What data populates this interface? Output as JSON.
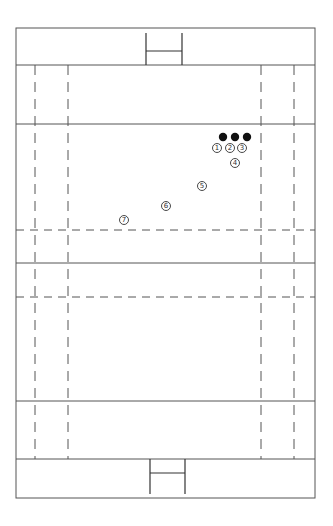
{
  "diagram": {
    "type": "rugby-pitch-play-diagram",
    "stroke_color": "#555555",
    "player_color": "#111111",
    "field": {
      "outer": {
        "x": 16,
        "y": 28,
        "w": 299,
        "h": 470
      },
      "solid_lines_y": [
        65,
        124,
        263,
        401,
        459
      ],
      "dashed_lines_y": [
        230,
        297
      ],
      "dashed_lines_x": [
        35,
        68,
        261,
        294
      ]
    },
    "posts": [
      {
        "position": "top",
        "left_x": 146,
        "right_x": 182,
        "y1": 33,
        "y2": 65,
        "crossbar_y": 51
      },
      {
        "position": "bottom",
        "left_x": 150,
        "right_x": 185,
        "y1": 459,
        "y2": 494,
        "crossbar_y": 473
      }
    ],
    "defenders": [
      {
        "id": "d1",
        "x": 223,
        "y": 137
      },
      {
        "id": "d2",
        "x": 235,
        "y": 137
      },
      {
        "id": "d3",
        "x": 247,
        "y": 137
      }
    ],
    "attackers": [
      {
        "label": "1",
        "x": 217,
        "y": 148
      },
      {
        "label": "2",
        "x": 230,
        "y": 148
      },
      {
        "label": "3",
        "x": 242,
        "y": 148
      },
      {
        "label": "4",
        "x": 235,
        "y": 163
      },
      {
        "label": "5",
        "x": 202,
        "y": 186
      },
      {
        "label": "6",
        "x": 166,
        "y": 206
      },
      {
        "label": "7",
        "x": 124,
        "y": 220
      }
    ]
  }
}
